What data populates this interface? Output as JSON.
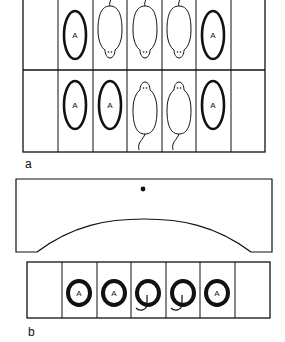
{
  "panels": {
    "a": {
      "label": "a",
      "description": "Top-view grid of 7 compartments in 2 rows",
      "rows": [
        [
          "empty",
          "ring",
          "mouse-tail-up",
          "mouse-tail-up",
          "mouse-tail-up",
          "ring",
          "empty"
        ],
        [
          "empty",
          "ring",
          "ring",
          "mouse-tail-down",
          "mouse-tail-down",
          "ring",
          "empty"
        ]
      ]
    },
    "b": {
      "label": "b",
      "description": "Arched cover above a 7-compartment strip",
      "cells": [
        "empty",
        "ring",
        "ring",
        "mouse-in-ring",
        "mouse-in-ring",
        "ring",
        "empty"
      ]
    }
  },
  "ring_letter": "A",
  "colors": {
    "stroke": "#111111",
    "background": "#ffffff"
  }
}
